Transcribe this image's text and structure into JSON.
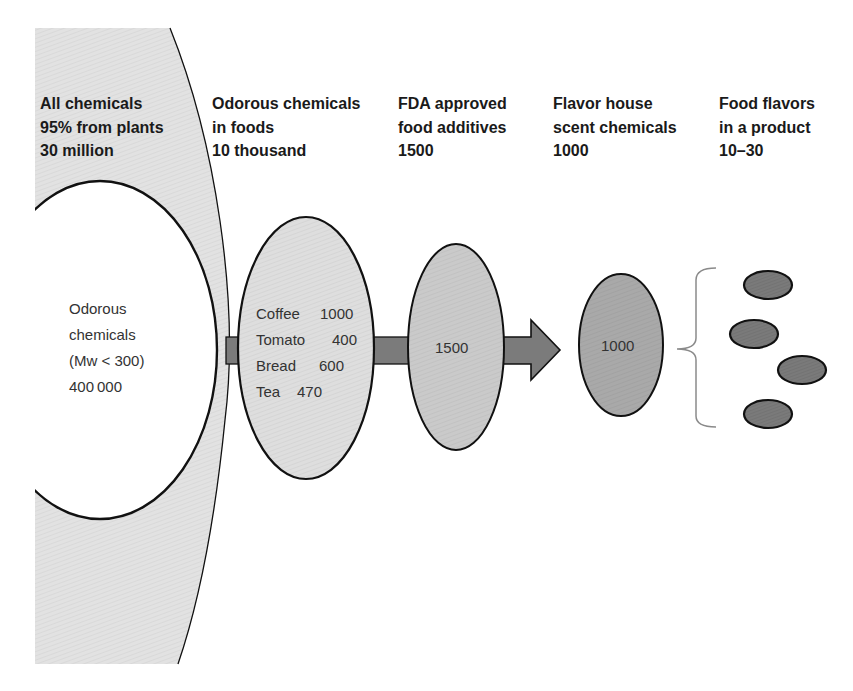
{
  "diagram": {
    "columns": [
      {
        "lines": [
          "All chemicals",
          "95% from plants",
          "30 million"
        ]
      },
      {
        "lines": [
          "Odorous chemicals",
          "in foods",
          "10 thousand"
        ]
      },
      {
        "lines": [
          "FDA approved",
          "food additives",
          "1500"
        ]
      },
      {
        "lines": [
          "Flavor house",
          "scent chemicals",
          "1000"
        ]
      },
      {
        "lines": [
          "Food flavors",
          "in a product",
          "10–30"
        ]
      }
    ],
    "odorous_subset": {
      "lines": [
        "Odorous",
        "chemicals",
        "(Mw < 300)",
        "400 000"
      ]
    },
    "food_sources": [
      {
        "name": "Coffee",
        "count": "1000"
      },
      {
        "name": "Tomato",
        "count": "400"
      },
      {
        "name": "Bread",
        "count": "600"
      },
      {
        "name": "Tea",
        "count": "470"
      }
    ],
    "fda_ellipse_label": "1500",
    "flavor_house_ellipse_label": "1000",
    "product_flavor_ovals": 4,
    "colors": {
      "all_chemicals_fill": "#e2e2e2",
      "odorous_subset_fill": "#ffffff",
      "food_ellipse_fill": "#dedede",
      "fda_ellipse_fill": "#cacaca",
      "flavor_house_fill": "#a9a9a9",
      "product_oval_fill": "#7a7a7a",
      "arrow_fill": "#7b7b7b",
      "outline": "#111111",
      "brace": "#8a8a8a",
      "text": "#1a1a1a"
    }
  }
}
